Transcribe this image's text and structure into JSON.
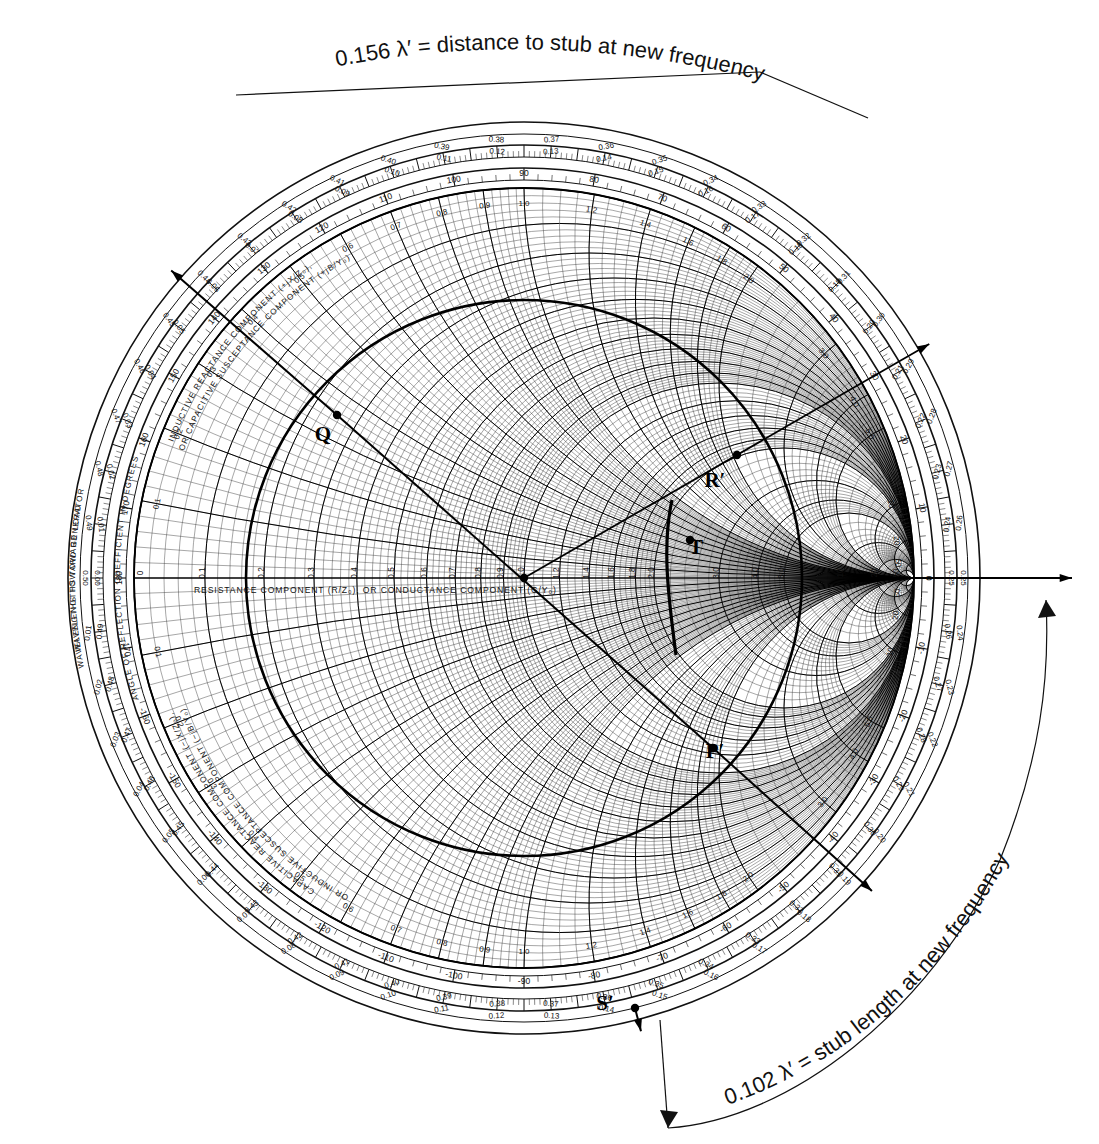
{
  "page": {
    "background": "#ffffff",
    "ink": "#111111"
  },
  "annotations": {
    "top": {
      "text": "0.156 λ′ = distance to stub at new frequency",
      "value": "0.156",
      "unit": "λ′",
      "meaning": "distance to stub at new frequency"
    },
    "bottom_right": {
      "text": "0.102 λ′ = stub length at new frequency",
      "value": "0.102",
      "unit": "λ′",
      "meaning": "stub length at new frequency"
    }
  },
  "chart_labels": {
    "center_axis": "RESISTANCE COMPONENT (R/Z₀), OR CONDUCTANCE COMPONENT (G/Y₀)",
    "center_axis_plain": "RESISTANCE COMPONENT  , OR CONDUCTANCE COMPONENT",
    "upper_arc_1": "INDUCTIVE REACTANCE COMPONENT (+jX/Z₀),",
    "upper_arc_2": "OR CAPACITIVE SUSCEPTANCE COMPONENT (+jB/Y₀)",
    "lower_arc_1": "CAPACITIVE REACTANCE COMPONENT (−jX/Z₀),",
    "lower_arc_2": "OR INDUCTIVE SUSCEPTANCE COMPONENT (−jB/Y₀)",
    "ring_outer_upper": "WAVELENGTHS TOWARD GENERATOR",
    "ring_outer_lower": "WAVELENGTHS TOWARD LOAD",
    "ring_angle": "ANGLE OF REFLECTION COEFFICIENT IN DEGREES"
  },
  "point_markers": [
    {
      "id": "Q",
      "label": "Q",
      "x": 337,
      "y": 415,
      "dx": -14,
      "dy": 26
    },
    {
      "id": "R",
      "label": "R′",
      "x": 737,
      "y": 455,
      "dx": -22,
      "dy": 32
    },
    {
      "id": "P",
      "label": "P′",
      "x": 713,
      "y": 748,
      "dx": 2,
      "dy": 10
    },
    {
      "id": "S",
      "label": "S′",
      "x": 635,
      "y": 1008,
      "dx": -30,
      "dy": 2
    },
    {
      "id": "T",
      "label": "T",
      "x": 690,
      "y": 540,
      "dx": 6,
      "dy": 14
    },
    {
      "id": "C",
      "label": "",
      "x": 524,
      "y": 578,
      "dx": 0,
      "dy": 0
    }
  ],
  "chart_data": {
    "type": "smith-chart",
    "center_px": [
      524,
      578
    ],
    "radius_px": 390,
    "resistance_circles": [
      0,
      0.1,
      0.2,
      0.3,
      0.4,
      0.5,
      0.6,
      0.7,
      0.8,
      0.9,
      1.0,
      1.2,
      1.4,
      1.6,
      1.8,
      2.0,
      3.0,
      4.0,
      5.0,
      10.0,
      20.0,
      50.0
    ],
    "resistance_labels": [
      "0",
      "0.1",
      "0.2",
      "0.3",
      "0.4",
      "0.5",
      "0.6",
      "0.7",
      "0.8",
      "0.9",
      "1.0",
      "1.2",
      "1.4",
      "1.6",
      "1.8",
      "2.0",
      "3.0",
      "4.0",
      "5.0",
      "10",
      "20",
      "50"
    ],
    "reactance_arcs": [
      0.1,
      0.2,
      0.3,
      0.4,
      0.5,
      0.6,
      0.7,
      0.8,
      0.9,
      1.0,
      1.2,
      1.4,
      1.6,
      1.8,
      2.0,
      3.0,
      4.0,
      5.0,
      10.0,
      20.0,
      50.0
    ],
    "reactance_labels": [
      "0.1",
      "0.2",
      "0.3",
      "0.4",
      "0.5",
      "0.6",
      "0.7",
      "0.8",
      "0.9",
      "1.0",
      "1.2",
      "1.4",
      "1.6",
      "1.8",
      "2.0",
      "3.0",
      "4.0",
      "5.0",
      "10",
      "20",
      "50"
    ],
    "constant_swr_circle": {
      "center_px": [
        524,
        578
      ],
      "radius_px": 278,
      "swr_approx": 3.1,
      "note": "heavy drawn circle through P′ and Q"
    },
    "wavelength_ring_outer": {
      "name": "WAVELENGTHS TOWARD GENERATOR",
      "start": 0.0,
      "end": 0.5,
      "step": 0.01,
      "major_labels": [
        "0.0",
        "0.01",
        "0.02",
        "0.03",
        "0.04",
        "0.05",
        "0.06",
        "0.07",
        "0.08",
        "0.09",
        "0.10",
        "0.11",
        "0.12",
        "0.13",
        "0.14",
        "0.15",
        "0.16",
        "0.17",
        "0.18",
        "0.19",
        "0.20",
        "0.21",
        "0.22",
        "0.23",
        "0.24",
        "0.25",
        "0.26",
        "0.27",
        "0.28",
        "0.29",
        "0.30",
        "0.31",
        "0.32",
        "0.33",
        "0.34",
        "0.35",
        "0.36",
        "0.37",
        "0.38",
        "0.39",
        "0.40",
        "0.41",
        "0.42",
        "0.43",
        "0.44",
        "0.45",
        "0.46",
        "0.47",
        "0.48",
        "0.49"
      ]
    },
    "wavelength_ring_inner": {
      "name": "WAVELENGTHS TOWARD LOAD",
      "start": 0.0,
      "end": 0.5,
      "step": 0.01
    },
    "angle_ring": {
      "name": "ANGLE OF REFLECTION COEFFICIENT IN DEGREES",
      "labels": [
        "0",
        "10",
        "20",
        "30",
        "40",
        "50",
        "60",
        "70",
        "80",
        "90",
        "100",
        "110",
        "120",
        "130",
        "140",
        "150",
        "160",
        "170",
        "180",
        "-170",
        "-160",
        "-150",
        "-140",
        "-130",
        "-120",
        "-110",
        "-100",
        "-90",
        "-80",
        "-70",
        "-60",
        "-50",
        "-40",
        "-30",
        "-20",
        "-10"
      ],
      "step_deg": 10
    },
    "key_readings": {
      "top_scale_marker": "0.156",
      "bottom_scale_marker": "0.102",
      "right_axis_wavelength": "0.25",
      "left_axis_wavelength": "0.0"
    }
  },
  "colors": {
    "ink": "#111111",
    "grid_light": "#3a3a3a",
    "grid_heavy": "#000000",
    "paper": "#ffffff"
  }
}
